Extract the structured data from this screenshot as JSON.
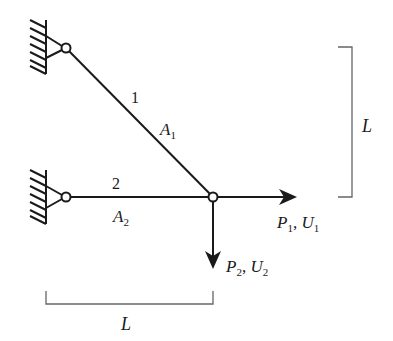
{
  "diagram": {
    "type": "two-bar truss",
    "members": [
      {
        "id": "1",
        "label": "1",
        "area_label": "A",
        "area_sub": "1"
      },
      {
        "id": "2",
        "label": "2",
        "area_label": "A",
        "area_sub": "2"
      }
    ],
    "loads": [
      {
        "id": "P1",
        "force": "P",
        "force_sub": "1",
        "sep": ", ",
        "disp": "U",
        "disp_sub": "1",
        "direction": "right"
      },
      {
        "id": "P2",
        "force": "P",
        "force_sub": "2",
        "sep": ", ",
        "disp": "U",
        "disp_sub": "2",
        "direction": "down"
      }
    ],
    "dimensions": {
      "vertical": "L",
      "horizontal": "L"
    },
    "supports": [
      "pin-top",
      "pin-bottom"
    ],
    "colors": {
      "line": "#1a1a1a",
      "dimension": "#555555"
    }
  }
}
